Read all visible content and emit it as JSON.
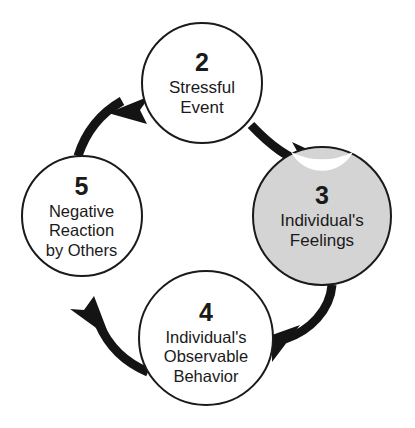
{
  "diagram": {
    "type": "cycle-flow",
    "colors": {
      "background": "#ffffff",
      "circle_stroke": "#1a1a1a",
      "circle_fill_default": "#ffffff",
      "circle_fill_highlight": "#d4d4d4",
      "arrow": "#141414",
      "text": "#1a1a1a"
    },
    "nodes": [
      {
        "id": "node-2",
        "number": "2",
        "label": "Stressful\nEvent",
        "fill": "#ffffff",
        "highlighted": false,
        "cx": 202,
        "cy": 83,
        "r": 60
      },
      {
        "id": "node-3",
        "number": "3",
        "label": "Individual's\nFeelings",
        "fill": "#d4d4d4",
        "highlighted": true,
        "cx": 322,
        "cy": 216,
        "r": 69
      },
      {
        "id": "node-4",
        "number": "4",
        "label": "Individual's\nObservable\nBehavior",
        "fill": "#ffffff",
        "highlighted": false,
        "cx": 206,
        "cy": 338,
        "r": 67
      },
      {
        "id": "node-5",
        "number": "5",
        "label": "Negative\nReaction\nby Others",
        "fill": "#ffffff",
        "highlighted": false,
        "cx": 82,
        "cy": 216,
        "r": 60
      }
    ],
    "arrows": [
      {
        "id": "arrow-2-to-3",
        "from": "node-2",
        "to": "node-3",
        "direction": "clockwise"
      },
      {
        "id": "arrow-3-to-4",
        "from": "node-3",
        "to": "node-4",
        "direction": "clockwise"
      },
      {
        "id": "arrow-4-to-5",
        "from": "node-4",
        "to": "node-5",
        "direction": "clockwise"
      },
      {
        "id": "arrow-5-to-2",
        "from": "node-5",
        "to": "node-2",
        "direction": "clockwise"
      }
    ]
  }
}
